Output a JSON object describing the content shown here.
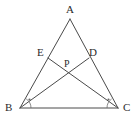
{
  "figure": {
    "background_color": "#ffffff",
    "line_color": "#4a4a4a",
    "mark_color": "#6b6b6b",
    "label_color": "#2b2b2b",
    "labels": {
      "apex": "A",
      "bottom_left": "B",
      "bottom_right": "C",
      "left_side_point": "E",
      "right_side_point": "D",
      "intersection": "P"
    },
    "points": {
      "A": {
        "x": 70,
        "y": 19
      },
      "B": {
        "x": 20,
        "y": 108
      },
      "C": {
        "x": 118,
        "y": 108
      },
      "E": {
        "x": 48,
        "y": 58
      },
      "D": {
        "x": 89,
        "y": 58
      },
      "P": {
        "x": 68,
        "y": 70
      }
    },
    "label_positions": {
      "A": {
        "x": 66,
        "y": 13
      },
      "B": {
        "x": 6,
        "y": 110
      },
      "C": {
        "x": 123,
        "y": 110
      },
      "E": {
        "x": 39,
        "y": 55
      },
      "D": {
        "x": 89,
        "y": 55
      },
      "P": {
        "x": 65,
        "y": 66
      }
    },
    "segments": [
      {
        "name": "side-AB",
        "from": "A",
        "to": "B"
      },
      {
        "name": "side-AC",
        "from": "A",
        "to": "C"
      },
      {
        "name": "base-BC",
        "from": "B",
        "to": "C"
      },
      {
        "name": "cevian-BD",
        "from": "B",
        "to": "D"
      },
      {
        "name": "cevian-CE",
        "from": "C",
        "to": "E"
      }
    ],
    "angle_marks": [
      {
        "name": "angle-mark-B",
        "vertex": "B",
        "radius": 11,
        "dot": {
          "x": 30,
          "y": 96
        }
      },
      {
        "name": "angle-mark-C",
        "vertex": "C",
        "radius": 11,
        "dot": {
          "x": 107,
          "y": 96
        }
      }
    ]
  }
}
